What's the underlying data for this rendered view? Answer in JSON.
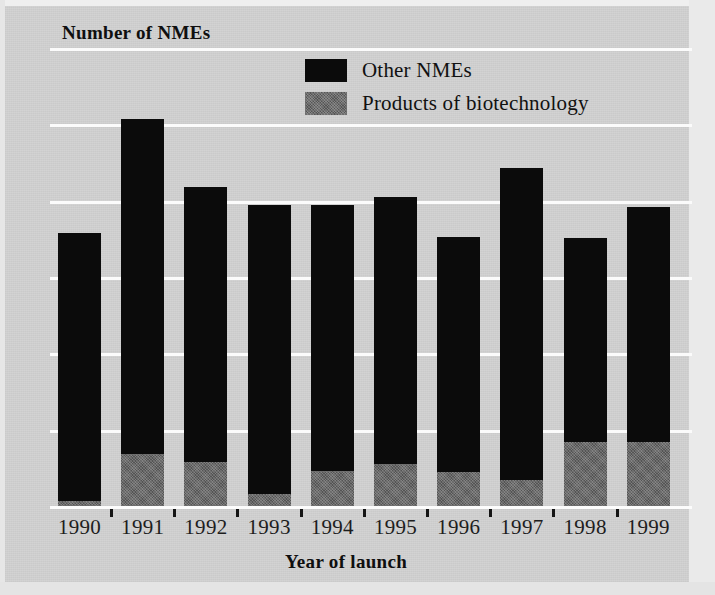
{
  "chart_data": {
    "type": "bar",
    "subtype": "stacked-bar",
    "title": "",
    "xlabel": "Year of launch",
    "ylabel": "Number of NMEs",
    "ylim": [
      0,
      60
    ],
    "yticks": [
      0,
      10,
      20,
      30,
      40,
      50,
      60
    ],
    "ytick_labels": [
      "0",
      "10",
      "20",
      "30",
      "40",
      "50",
      "60"
    ],
    "grid": "horizontal",
    "grid_color": "#fbfbfb",
    "background_color": "#d1d1d1",
    "legend_position": "top-center-right",
    "categories": [
      "1990",
      "1991",
      "1992",
      "1993",
      "1994",
      "1995",
      "1996",
      "1997",
      "1998",
      "1999"
    ],
    "series": [
      {
        "name": "Products of biotechnology",
        "color": "#545454",
        "values": [
          0.9,
          7.1,
          6.0,
          1.8,
          4.9,
          5.8,
          4.7,
          3.7,
          8.7,
          8.6
        ]
      },
      {
        "name": "Other NMEs",
        "color": "#0b0b0b",
        "values": [
          35.1,
          43.9,
          36.0,
          37.9,
          34.8,
          35.0,
          30.8,
          40.8,
          26.7,
          30.8
        ]
      }
    ],
    "totals": [
      36.0,
      51.0,
      42.0,
      39.7,
      39.7,
      40.8,
      35.5,
      44.5,
      35.4,
      39.4
    ]
  },
  "legend": {
    "items": [
      {
        "label": "Other NMEs",
        "swatch": "black-swatch-icon"
      },
      {
        "label": "Products of biotechnology",
        "swatch": "gray-swatch-icon"
      }
    ]
  }
}
